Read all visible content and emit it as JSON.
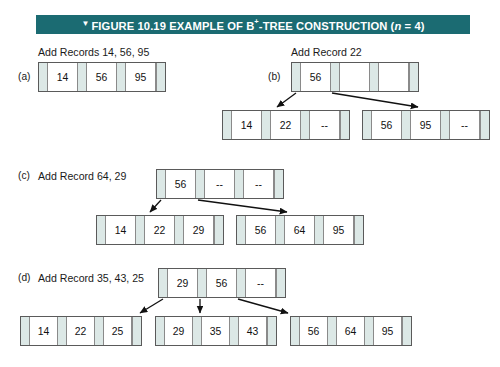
{
  "figure": {
    "marker": "▼",
    "title_prefix": "FIGURE 10.19 EXAMPLE OF B",
    "title_superscript": "+",
    "title_suffix": "-TREE CONSTRUCTION (",
    "title_param": "n",
    "title_end": " = 4)",
    "bar_color": "#1b6b72",
    "bar_text_color": "#ffffff"
  },
  "steps": [
    {
      "id": "a",
      "label": "(a)",
      "caption": "Add Records 14, 56, 95",
      "root": {
        "cells": [
          "14",
          "56",
          "95"
        ]
      },
      "children": []
    },
    {
      "id": "b",
      "label": "(b)",
      "caption": "Add Record 22",
      "root": {
        "cells": [
          "56",
          "",
          ""
        ]
      },
      "children": [
        {
          "cells": [
            "14",
            "22",
            "--"
          ]
        },
        {
          "cells": [
            "56",
            "95",
            "--"
          ]
        }
      ]
    },
    {
      "id": "c",
      "label": "(c)",
      "caption": "Add Record 64, 29",
      "root": {
        "cells": [
          "56",
          "--",
          "--"
        ]
      },
      "children": [
        {
          "cells": [
            "14",
            "22",
            "29"
          ]
        },
        {
          "cells": [
            "56",
            "64",
            "95"
          ]
        }
      ]
    },
    {
      "id": "d",
      "label": "(d)",
      "caption": "Add Record 35, 43, 25",
      "root": {
        "cells": [
          "29",
          "56",
          "--"
        ]
      },
      "children": [
        {
          "cells": [
            "14",
            "22",
            "25"
          ]
        },
        {
          "cells": [
            "29",
            "35",
            "43"
          ]
        },
        {
          "cells": [
            "56",
            "64",
            "95"
          ]
        }
      ]
    }
  ],
  "colors": {
    "pointer_cell": "#dce8e6",
    "value_cell": "#ffffff",
    "node_border": "#5a5a5a",
    "arrow": "#111111"
  }
}
